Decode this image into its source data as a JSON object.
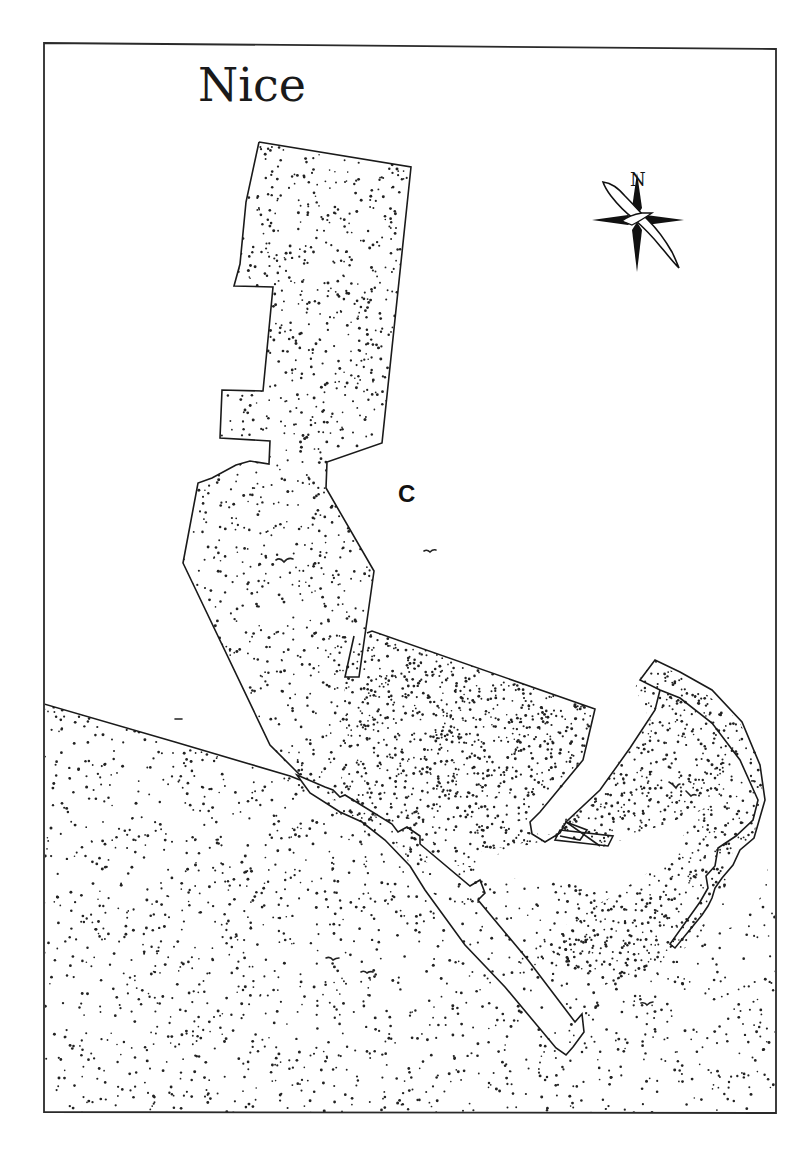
{
  "map": {
    "title": "Nice",
    "area_label": "C",
    "compass": {
      "north_label": "N",
      "icon": "compass-rose-with-albatross"
    },
    "colors": {
      "ink": "#1a1a1a",
      "paper": "#ffffff",
      "stipple": "#222222"
    },
    "frame": {
      "x": 44,
      "y": 44,
      "width": 732,
      "height": 1069
    },
    "features": [
      {
        "name": "main-jetty-landmass",
        "type": "land"
      },
      {
        "name": "port-basin-landmass",
        "type": "land"
      },
      {
        "name": "eastern-headland",
        "type": "land"
      },
      {
        "name": "western-shore",
        "type": "land"
      },
      {
        "name": "promenade-quay",
        "type": "quay"
      },
      {
        "name": "east-breakwater",
        "type": "quay"
      },
      {
        "name": "south-pier",
        "type": "quay"
      }
    ],
    "birds_count": 8
  }
}
